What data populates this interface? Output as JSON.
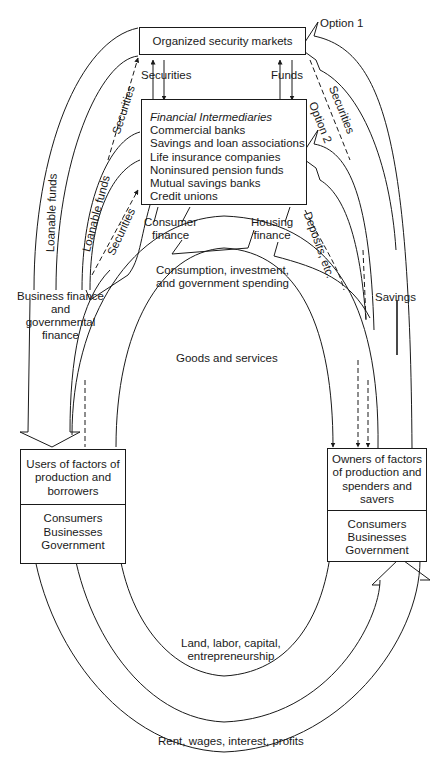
{
  "diagram": {
    "type": "circular-flow-financial-system",
    "nodes": {
      "security_markets": {
        "label": "Organized security markets"
      },
      "intermediaries": {
        "title": "Financial Intermediaries",
        "items": [
          "Commercial banks",
          "Savings and loan associations",
          "Life insurance companies",
          "Noninsured pension funds",
          "Mutual savings banks",
          "Credit unions"
        ]
      },
      "users": {
        "lines": [
          "Users of factors of",
          "production and",
          "borrowers"
        ],
        "sectors": [
          "Consumers",
          "Businesses",
          "Government"
        ]
      },
      "owners": {
        "lines": [
          "Owners of factors",
          "of production and",
          "spenders and",
          "savers"
        ],
        "sectors": [
          "Consumers",
          "Businesses",
          "Government"
        ]
      }
    },
    "flow_labels": {
      "option1": "Option 1",
      "option2": "Option 2",
      "securities_top_left": "Securities",
      "funds_top": "Funds",
      "securities_left_outer": "Securities",
      "securities_left_inner": "Securities",
      "securities_right": "Securities",
      "loanable_funds_outer": "Loanable funds",
      "loanable_funds_inner": "Loanable funds",
      "consumer_finance": [
        "Consumer",
        "finance"
      ],
      "housing_finance": [
        "Housing",
        "finance"
      ],
      "deposits": "Deposits, etc.",
      "savings": "Savings",
      "business_finance": [
        "Business finance",
        "and",
        "governmental",
        "finance"
      ],
      "spending": [
        "Consumption, investment,",
        "and government spending"
      ],
      "goods_services": "Goods and services",
      "factors": [
        "Land, labor, capital,",
        "entrepreneurship"
      ],
      "income": "Rent, wages, interest, profits"
    }
  }
}
